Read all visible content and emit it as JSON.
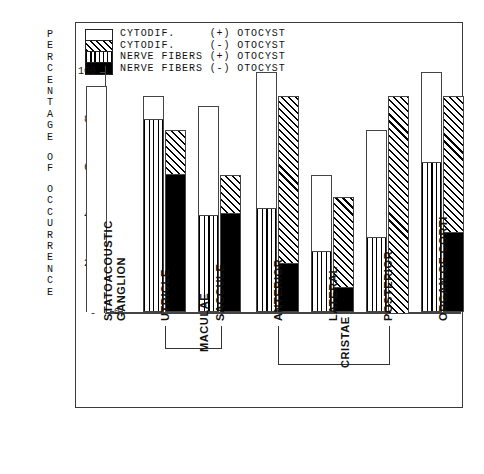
{
  "chart_data": {
    "type": "bar",
    "title": "",
    "xlabel": "",
    "ylabel": "PERCENTAGE OF OCCURRENCE",
    "ylim": [
      0,
      100
    ],
    "yticks": [
      0,
      20,
      40,
      60,
      80,
      100
    ],
    "grid": false,
    "legend_position": "top-left",
    "legend": [
      {
        "key": "cytodif_plus",
        "label": "CYTODIF.     (+) OTOCYST",
        "pattern": "white"
      },
      {
        "key": "cytodif_minus",
        "label": "CYTODIF.     (-) OTOCYST",
        "pattern": "diagonal-hatch"
      },
      {
        "key": "nerve_plus",
        "label": "NERVE FIBERS (+) OTOCYST",
        "pattern": "vertical-lines"
      },
      {
        "key": "nerve_minus",
        "label": "NERVE FIBERS (-) OTOCYST",
        "pattern": "solid-black"
      }
    ],
    "categories": [
      "STATOACOUSTIC GANGLION",
      "UTRICLE",
      "SACCULE",
      "ANTERIOR",
      "LATERAL",
      "POSTERIOR",
      "ORGAN OF CORTI"
    ],
    "category_lines": [
      [
        "STATOACOUSTIC",
        "GANGLION"
      ],
      [
        "UTRICLE"
      ],
      [
        "SACCULE"
      ],
      [
        "ANTERIOR"
      ],
      [
        "LATERAL"
      ],
      [
        "POSTERIOR"
      ],
      [
        "ORGAN OF CORTI"
      ]
    ],
    "groups": [
      {
        "label": "MACULAE",
        "members": [
          "UTRICLE",
          "SACCULE"
        ]
      },
      {
        "label": "CRISTAE",
        "members": [
          "ANTERIOR",
          "LATERAL",
          "POSTERIOR"
        ]
      }
    ],
    "series": [
      {
        "name": "CYTODIF. (+) OTOCYST",
        "values": [
          94,
          90,
          86,
          100,
          57,
          76,
          100
        ]
      },
      {
        "name": "NERVE FIBERS (+) OTOCYST",
        "values": [
          0,
          80,
          40,
          43,
          25,
          31,
          62
        ]
      },
      {
        "name": "CYTODIF. (-) OTOCYST",
        "values": [
          0,
          76,
          57,
          90,
          48,
          90,
          90
        ]
      },
      {
        "name": "NERVE FIBERS (-) OTOCYST",
        "values": [
          0,
          57,
          41,
          20,
          10,
          0,
          33
        ]
      }
    ],
    "zero_annotation": {
      "label": "0",
      "applies_to": "STATOACOUSTIC GANGLION (-) OTOCYST"
    }
  }
}
